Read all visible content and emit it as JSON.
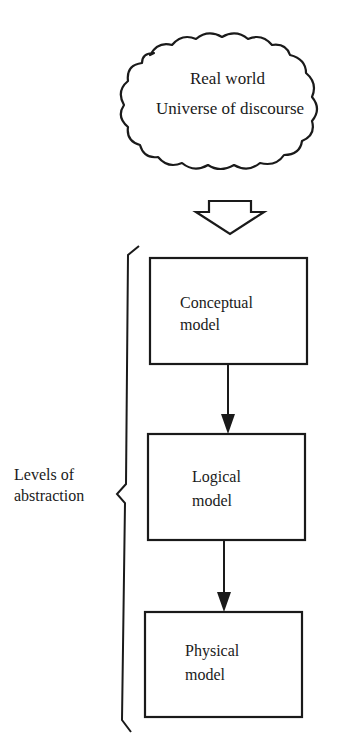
{
  "cloud": {
    "line1": "Real world",
    "line2": "Universe of discourse"
  },
  "transition_arrow": {
    "icon": "hollow-down-arrow-icon"
  },
  "boxes": [
    {
      "line1": "Conceptual",
      "line2": "model"
    },
    {
      "line1": "Logical",
      "line2": "model"
    },
    {
      "line1": "Physical",
      "line2": "model"
    }
  ],
  "brace_label": {
    "line1": "Levels of",
    "line2": "abstraction"
  },
  "colors": {
    "ink": "#1a1a1a",
    "paper": "#ffffff"
  }
}
